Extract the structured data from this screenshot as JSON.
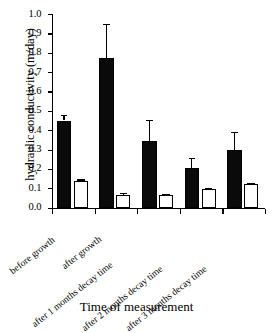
{
  "chart_data": {
    "type": "bar",
    "title": "",
    "xlabel": "Time of measurement",
    "ylabel": "hydraulic conductivity (m/day)",
    "ylim": [
      0.0,
      1.0
    ],
    "yticks": [
      "0.0",
      "0.1",
      "0.2",
      "0.3",
      "0.4",
      "0.5",
      "0.6",
      "0.7",
      "0.8",
      "0.9",
      "1.0"
    ],
    "grid": false,
    "legend": "none",
    "categories": [
      "before growth",
      "after growth",
      "after 1 months decay time",
      "after 2 months decay time",
      "after 3 months decay time"
    ],
    "series": [
      {
        "name": "filled",
        "fill": "#000000",
        "values": [
          0.45,
          0.775,
          0.345,
          0.205,
          0.3
        ],
        "errors": [
          0.03,
          0.175,
          0.11,
          0.05,
          0.09
        ]
      },
      {
        "name": "open",
        "fill": "#ffffff",
        "values": [
          0.14,
          0.067,
          0.064,
          0.098,
          0.122
        ],
        "errors": [
          0.006,
          0.008,
          0.006,
          0.004,
          0.005
        ]
      }
    ]
  },
  "axis": {
    "y_title": "hydraulic conductivity (m/day)",
    "x_title": "Time of measurement",
    "tick_0": "0.0",
    "tick_1": "0.1",
    "tick_2": "0.2",
    "tick_3": "0.3",
    "tick_4": "0.4",
    "tick_5": "0.5",
    "tick_6": "0.6",
    "tick_7": "0.7",
    "tick_8": "0.8",
    "tick_9": "0.9",
    "tick_10": "1.0"
  },
  "xlabels": {
    "l0": "before growth",
    "l1": "after growth",
    "l2": "after 1 months decay time",
    "l3": "after 2 months decay time",
    "l4": "after 3 months decay time"
  }
}
